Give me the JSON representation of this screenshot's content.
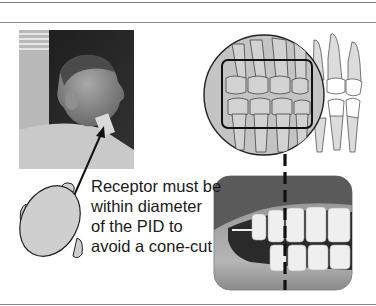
{
  "figure": {
    "caption_lines": [
      "Receptor must be",
      "within diameter",
      "of the PID to",
      "avoid a cone-cut"
    ],
    "elements": {
      "patient_photo": "grayscale photo of patient profile with PID cone against cheek",
      "head_diagram": "top-view oval head with ears and nose",
      "dentition_diagram": "lateral view of teeth with circular PID outline and rectangular receptor outline",
      "mouth_photo": "close-up photo of teeth in occlusion"
    },
    "colors": {
      "rule": "#7a7a7a",
      "head_fill": "#cfcfcf",
      "circle_fill": "#c4c4c4",
      "tooth_fill": "#dcdcdc",
      "outline": "#222222",
      "dash": "#111111"
    }
  }
}
